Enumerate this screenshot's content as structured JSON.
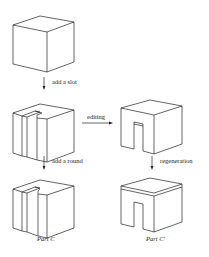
{
  "diagram": {
    "steps": {
      "step1": "add a slot",
      "step2": "add a round",
      "edit": "editing",
      "regen": "regeneration"
    },
    "parts": {
      "left": "Part C",
      "right": "Part C'"
    },
    "colors": {
      "line": "#222222",
      "background": "#ffffff"
    }
  }
}
